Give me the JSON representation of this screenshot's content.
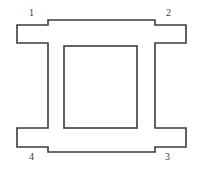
{
  "figure": {
    "kind": "engineering-outline-drawing",
    "canvas": {
      "width": 202,
      "height": 172,
      "background": "#ffffff"
    },
    "stroke": {
      "color": "#3b3b3b",
      "width": 1.6,
      "join": "miter",
      "fill": "none"
    }
  },
  "outer_outline": {
    "name": "outer-profile",
    "points": "48,20 155,20 155,25 186,25 186,43 155,43 155,128 186,128 186,147 155,147 155,152 48,152 48,147 17,147 17,128 48,128 48,43 17,43 17,25 48,25",
    "closed": true
  },
  "inner_opening": {
    "name": "inner-square-opening",
    "x": 64,
    "y": 46,
    "width": 73,
    "height": 82
  },
  "labels": [
    {
      "id": "label-1",
      "text": "1",
      "position": "top-left",
      "x": 29,
      "y": 8
    },
    {
      "id": "label-2",
      "text": "2",
      "position": "top-right",
      "x": 166,
      "y": 8
    },
    {
      "id": "label-3",
      "text": "3",
      "position": "bottom-right",
      "x": 165,
      "y": 152
    },
    {
      "id": "label-4",
      "text": "4",
      "position": "bottom-left",
      "x": 29,
      "y": 152
    }
  ],
  "label_text": {
    "one": "1",
    "two": "2",
    "three": "3",
    "four": "4"
  }
}
